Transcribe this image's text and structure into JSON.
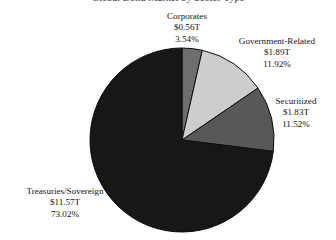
{
  "chart_data": {
    "type": "pie",
    "title": "Global Bond Market by Sector Type",
    "title_cropped": true,
    "categories": [
      "Corporates",
      "Government-Related",
      "Securitized",
      "Treasuries/Sovereign"
    ],
    "values": [
      3.54,
      11.92,
      11.52,
      73.02
    ],
    "value_unit": "%",
    "amounts": [
      "$0.56T",
      "$1.89T",
      "$1.83T",
      "$11.57T"
    ],
    "amounts_numeric": [
      0.56,
      1.89,
      1.83,
      11.57
    ],
    "amount_unit": "trillion USD",
    "start_angle_deg": 0,
    "direction": "clockwise",
    "legend": "none",
    "labels_position": "outside-callout",
    "slices": [
      {
        "name": "Corporates",
        "amount": "$0.56T",
        "percent": "3.54%",
        "value": 3.54,
        "color": "#6e6e6e"
      },
      {
        "name": "Government-Related",
        "amount": "$1.89T",
        "percent": "11.92%",
        "value": 11.92,
        "color": "#cdcdcd"
      },
      {
        "name": "Securitized",
        "amount": "$1.83T",
        "percent": "11.52%",
        "value": 11.52,
        "color": "#585858"
      },
      {
        "name": "Treasuries/Sovereign",
        "amount": "$11.57T",
        "percent": "73.02%",
        "value": 73.02,
        "color": "#171717"
      }
    ],
    "geometry": {
      "center_x": 182,
      "center_y": 140,
      "radius": 92
    }
  }
}
